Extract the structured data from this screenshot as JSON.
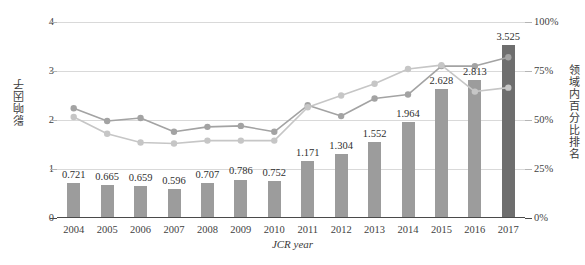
{
  "chart_data": {
    "type": "bar",
    "title": "",
    "xlabel": "JCR year",
    "ylabel": "影响因子",
    "y2label": "领域内百分比排名",
    "categories": [
      "2004",
      "2005",
      "2006",
      "2007",
      "2008",
      "2009",
      "2010",
      "2011",
      "2012",
      "2013",
      "2014",
      "2015",
      "2016",
      "2017"
    ],
    "ylim": [
      0,
      4
    ],
    "y2lim": [
      0,
      100
    ],
    "yticks": [
      "0",
      "1",
      "2",
      "3",
      "4"
    ],
    "ytick_values": [
      0,
      1,
      2,
      3,
      4
    ],
    "y2ticks": [
      "0%",
      "25%",
      "50%",
      "75%",
      "100%"
    ],
    "y2tick_values": [
      0,
      25,
      50,
      75,
      100
    ],
    "grid": true,
    "legend": "none",
    "series": [
      {
        "name": "影响因子",
        "type": "bar",
        "axis": "left",
        "values": [
          0.721,
          0.665,
          0.659,
          0.596,
          0.707,
          0.786,
          0.752,
          1.171,
          1.304,
          1.552,
          1.964,
          2.628,
          2.813,
          3.525
        ],
        "labels": [
          "0.721",
          "0.665",
          "0.659",
          "0.596",
          "0.707",
          "0.786",
          "0.752",
          "1.171",
          "1.304",
          "1.552",
          "1.964",
          "2.628",
          "2.813",
          "3.525"
        ],
        "color": "#9c9c9c",
        "highlight_index": 13,
        "highlight_color": "#6e6e6e"
      },
      {
        "name": "领域内百分比排名 A",
        "type": "line",
        "axis": "right",
        "values": [
          56.0,
          49.5,
          51.0,
          44.0,
          46.5,
          47.0,
          44.0,
          57.5,
          52.0,
          61.0,
          63.0,
          77.5,
          77.5,
          82.0
        ],
        "color": "#a3a3a3"
      },
      {
        "name": "领域内百分比排名 B",
        "type": "line",
        "axis": "right",
        "values": [
          51.5,
          43.0,
          38.5,
          38.0,
          39.5,
          39.5,
          39.5,
          56.5,
          62.5,
          68.5,
          76.0,
          78.0,
          64.5,
          66.5
        ],
        "color": "#c6c6c6"
      }
    ]
  },
  "axis": {
    "left_title": "影响因子",
    "right_title": "领域内百分比排名",
    "x_title": "JCR year"
  },
  "caption": ""
}
